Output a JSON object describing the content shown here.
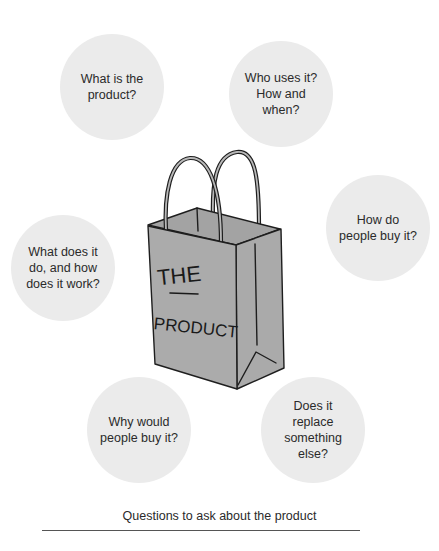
{
  "diagram": {
    "center": {
      "kind": "shopping-bag-illustration",
      "label_line1": "THE",
      "label_line2": "PRODUCT",
      "colors": {
        "bag_fill": "#ababab",
        "stroke": "#1e1e1e"
      }
    },
    "bubbles": [
      {
        "id": "what-is",
        "text": "What is the\nproduct?"
      },
      {
        "id": "who-uses",
        "text": "Who uses it?\nHow and\nwhen?"
      },
      {
        "id": "how-buy",
        "text": "How do\npeople buy it?"
      },
      {
        "id": "what-does",
        "text": "What does it\ndo, and how\ndoes it work?"
      },
      {
        "id": "why-buy",
        "text": "Why would\npeople buy it?"
      },
      {
        "id": "replace",
        "text": "Does it\nreplace\nsomething\nelse?"
      }
    ],
    "bubble_color": "#ebebeb",
    "caption": "Questions to ask about the product"
  }
}
